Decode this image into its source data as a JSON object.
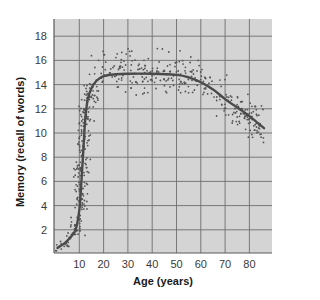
{
  "chart_data": {
    "type": "scatter",
    "title": "",
    "xlabel": "Age (years)",
    "ylabel": "Memory (recall of words)",
    "xlim": [
      0,
      88
    ],
    "ylim": [
      0,
      19.5
    ],
    "x_ticks": [
      10,
      20,
      30,
      40,
      50,
      60,
      70,
      80
    ],
    "y_ticks": [
      2,
      4,
      6,
      8,
      10,
      12,
      14,
      16,
      18
    ],
    "grid": true,
    "legend": null,
    "series": [
      {
        "name": "Trend curve",
        "kind": "line",
        "x": [
          1,
          4,
          6,
          8,
          9,
          10,
          10.5,
          11,
          11.5,
          12,
          12.5,
          13.5,
          15,
          17,
          20,
          25,
          30,
          40,
          50,
          55,
          60,
          65,
          70,
          75,
          80,
          83,
          86
        ],
        "values": [
          0.5,
          0.9,
          1.3,
          1.8,
          2.4,
          3.6,
          4.8,
          6.4,
          8.0,
          9.8,
          11.3,
          12.8,
          13.7,
          14.3,
          14.7,
          14.85,
          14.9,
          14.9,
          14.8,
          14.6,
          14.2,
          13.6,
          12.8,
          12.1,
          11.4,
          10.9,
          10.4
        ]
      },
      {
        "name": "Individual scores",
        "kind": "scatter",
        "description": "Dense cloud of individual data points scattered around the curve; spread roughly ±2 words around trend, widest during ages 8–15"
      }
    ]
  },
  "colors": {
    "plot_background": "#d4d4d4",
    "grid": "#6e6e6e",
    "curve": "#4a4a4a",
    "points": "#555555",
    "axis": "#5a5a5a"
  }
}
